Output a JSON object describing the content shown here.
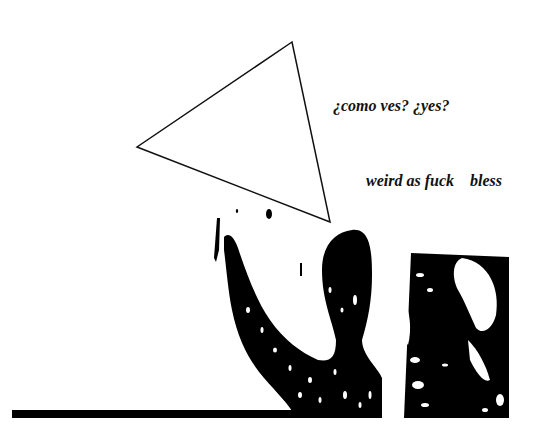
{
  "texts": {
    "question": "¿como ves? ¿yes?",
    "phrase": "weird as fuck    bless"
  },
  "shapes": {
    "triangle": {
      "points": "292,42 137,147 330,222",
      "stroke": "#111111",
      "stroke_width": 1.5
    },
    "bar": {
      "x": 12,
      "y": 410,
      "width": 290,
      "height": 8,
      "fill": "#000000"
    }
  },
  "colors": {
    "background": "#ffffff",
    "ink": "#000000"
  }
}
